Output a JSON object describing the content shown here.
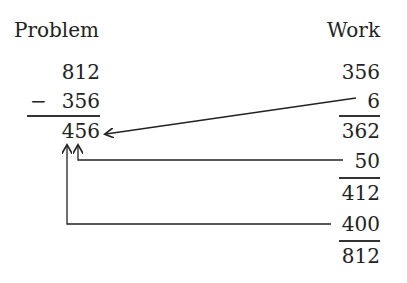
{
  "headers": {
    "problem": "Problem",
    "work": "Work"
  },
  "problem": {
    "minuend": "812",
    "minus_sign": "−",
    "subtrahend": "356",
    "answer": "456"
  },
  "work": {
    "start": "356",
    "steps": [
      {
        "add": "6",
        "result": "362"
      },
      {
        "add": "50",
        "result": "412"
      },
      {
        "add": "400",
        "result": "812"
      }
    ]
  }
}
